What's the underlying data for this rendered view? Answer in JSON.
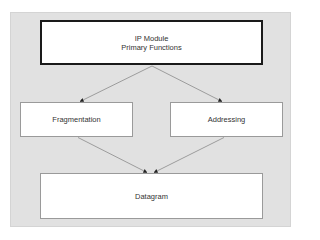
{
  "diagram": {
    "type": "flowchart",
    "nodes": {
      "primary": {
        "line1": "IP Module",
        "line2": "Primary Functions"
      },
      "fragmentation": {
        "label": "Fragmentation"
      },
      "addressing": {
        "label": "Addressing"
      },
      "datagram": {
        "label": "Datagram"
      }
    },
    "edges": [
      {
        "from": "IP Module Primary Functions",
        "to": "Fragmentation"
      },
      {
        "from": "IP Module Primary Functions",
        "to": "Addressing"
      },
      {
        "from": "Fragmentation",
        "to": "Datagram"
      },
      {
        "from": "Addressing",
        "to": "Datagram"
      }
    ],
    "colors": {
      "panel": "#e1e1e1",
      "node_fill": "#ffffff",
      "primary_border": "#1a1a1a",
      "node_border": "#9a9a9a",
      "edge": "#8a8a8a",
      "arrowhead": "#222222",
      "text": "#333333"
    }
  }
}
